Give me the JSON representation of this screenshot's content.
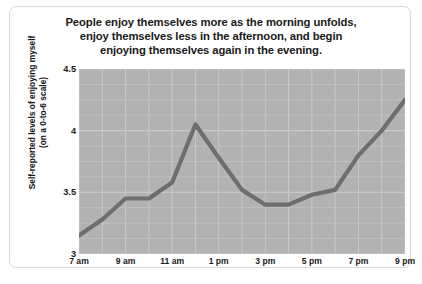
{
  "chart_data": {
    "type": "line",
    "title": "People enjoy themselves more as the morning unfolds, enjoy themselves less in the afternoon, and begin enjoying themselves again in the evening.",
    "title_lines": [
      "People enjoy themselves more as the morning unfolds,",
      "enjoy themselves less in the afternoon, and begin",
      "enjoying themselves again in the evening."
    ],
    "xlabel": "",
    "ylabel": "Self-reported levels of enjoying myself (on a 0-to-6 scale)",
    "ylabel_lines": [
      "Self-reported levels of enjoying myself",
      "(on a 0-to-6 scale)"
    ],
    "ylim": [
      3,
      4.5
    ],
    "yticks": [
      "3",
      "3.5",
      "4",
      "4.5"
    ],
    "ytick_values": [
      3,
      3.5,
      4,
      4.5
    ],
    "xlim": [
      7,
      21
    ],
    "xticks": [
      "7 am",
      "9 am",
      "11 am",
      "1 pm",
      "3 pm",
      "5 pm",
      "7 pm",
      "9 pm"
    ],
    "xtick_values": [
      7,
      9,
      11,
      13,
      15,
      17,
      19,
      21
    ],
    "x": [
      7,
      8,
      9,
      10,
      11,
      12,
      13,
      14,
      15,
      16,
      17,
      18,
      19,
      20,
      21
    ],
    "values": [
      3.15,
      3.28,
      3.45,
      3.45,
      3.58,
      4.05,
      3.78,
      3.52,
      3.4,
      3.4,
      3.48,
      3.52,
      3.8,
      4.0,
      4.25
    ],
    "series": [
      {
        "name": "Self-reported enjoyment",
        "values": [
          3.15,
          3.28,
          3.45,
          3.45,
          3.58,
          4.05,
          3.78,
          3.52,
          3.4,
          3.4,
          3.48,
          3.52,
          3.8,
          4.0,
          4.25
        ]
      }
    ],
    "grid": true,
    "grid_x_step": 1,
    "grid_y_step": 0.125,
    "legend": false,
    "line_color": "#6e6e6e",
    "plot_background": "#b2b2b2",
    "grid_color": "#c9c9c9",
    "card_background": "#ffffff"
  }
}
